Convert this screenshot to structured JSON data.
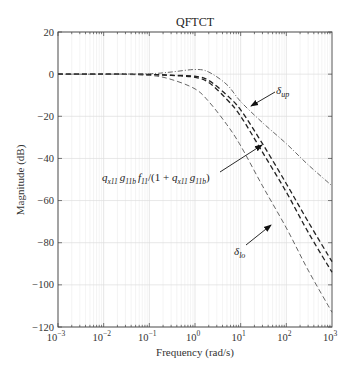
{
  "chart_data": {
    "type": "line",
    "title": "QFTCT",
    "xlabel": "Frequency (rad/s)",
    "ylabel": "Magnitude (dB)",
    "xscale": "log",
    "xlim": [
      0.001,
      1000
    ],
    "ylim": [
      -120,
      20
    ],
    "grid": true,
    "x_ticks": [
      "10^-3",
      "10^-2",
      "10^-1",
      "10^0",
      "10^1",
      "10^2",
      "10^3"
    ],
    "y_ticks": [
      20,
      0,
      -20,
      -40,
      -60,
      -80,
      -100,
      -120
    ],
    "series": [
      {
        "name": "δ_up",
        "style": "dash-dot",
        "x": [
          0.001,
          0.01,
          0.1,
          0.3,
          1,
          2,
          5,
          10,
          30,
          100,
          300,
          1000
        ],
        "y": [
          0,
          0,
          0.2,
          1.0,
          2.2,
          1.0,
          -5,
          -13,
          -23,
          -33,
          -43,
          -53
        ]
      },
      {
        "name": "q_x11 g_11b f_11/(1 + q_x11 g_11b) (upper)",
        "style": "dashed",
        "x": [
          0.001,
          0.01,
          0.1,
          0.3,
          1,
          2,
          5,
          10,
          30,
          100,
          300,
          1000
        ],
        "y": [
          0,
          0,
          -0.2,
          -0.5,
          -1.0,
          -3,
          -10,
          -17,
          -33,
          -52,
          -70,
          -89
        ]
      },
      {
        "name": "q_x11 g_11b f_11/(1 + q_x11 g_11b) (lower)",
        "style": "dashed",
        "x": [
          0.001,
          0.01,
          0.1,
          0.3,
          1,
          2,
          5,
          10,
          30,
          100,
          300,
          1000
        ],
        "y": [
          0,
          0,
          -0.2,
          -0.6,
          -1.5,
          -4,
          -12,
          -20,
          -37,
          -56,
          -75,
          -94
        ]
      },
      {
        "name": "δ_lo",
        "style": "dashed",
        "x": [
          0.001,
          0.01,
          0.1,
          0.3,
          1,
          2,
          5,
          10,
          30,
          100,
          300,
          1000
        ],
        "y": [
          0,
          0,
          -0.6,
          -2.5,
          -7,
          -13,
          -24,
          -34,
          -53,
          -73,
          -93,
          -113
        ]
      }
    ],
    "annotations": [
      {
        "text": "δ_up",
        "arrow_to": [
          20,
          -16
        ]
      },
      {
        "text": "q_x11 g_11b f_11/(1 + q_x11 g_11b)",
        "arrow_to": [
          30,
          -33
        ]
      },
      {
        "text": "δ_lo",
        "arrow_to": [
          90,
          -68
        ]
      }
    ]
  },
  "labels": {
    "title": "QFTCT",
    "xlabel": "Frequency (rad/s)",
    "ylabel": "Magnitude (dB)",
    "x_ticks": [
      {
        "base": "10",
        "exp": "−3"
      },
      {
        "base": "10",
        "exp": "−2"
      },
      {
        "base": "10",
        "exp": "−1"
      },
      {
        "base": "10",
        "exp": "0"
      },
      {
        "base": "10",
        "exp": "1"
      },
      {
        "base": "10",
        "exp": "2"
      },
      {
        "base": "10",
        "exp": "3"
      }
    ],
    "y_ticks": [
      "20",
      "0",
      "−20",
      "−40",
      "−60",
      "−80",
      "−100",
      "−120"
    ],
    "annot_up_sym": "δ",
    "annot_up_sub": "up",
    "annot_lo_sym": "δ",
    "annot_lo_sub": "lo",
    "annot_mid": {
      "q": "q",
      "q_sub": "x11",
      "g": "g",
      "g_sub": "11b",
      "f": "f",
      "f_sub": "11",
      "mid": "/(1 + ",
      "q2": "q",
      "q2_sub": "x11",
      "g2": "g",
      "g2_sub": "11b",
      "end": ")"
    }
  }
}
